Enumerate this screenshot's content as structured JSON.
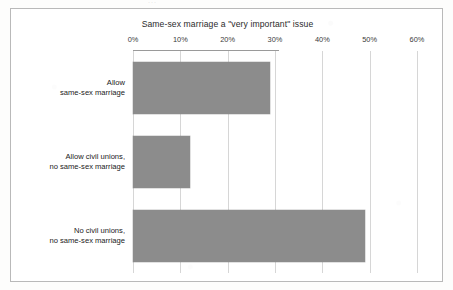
{
  "figure": {
    "title": "Same-sex marriage a \"very important\" issue",
    "frame_color": "#b9b9b9",
    "background": "#ffffff"
  },
  "scan_marks": {
    "top": "···",
    "left": "\\"
  },
  "chart_data": {
    "type": "bar",
    "orientation": "horizontal",
    "title": "Same-sex marriage a \"very important\" issue",
    "xlabel": "",
    "ylabel": "",
    "categories": [
      "Allow same-sex marriage",
      "Allow civil unions, no same-sex marriage",
      "No civil unions, no same-sex marriage"
    ],
    "category_lines": [
      [
        "Allow",
        "same-sex marriage"
      ],
      [
        "Allow civil unions,",
        "no same-sex marriage"
      ],
      [
        "No civil unions,",
        "no same-sex marriage"
      ]
    ],
    "values": [
      29,
      12,
      49
    ],
    "value_unit": "%",
    "xlim": [
      0,
      60
    ],
    "xticks": [
      0,
      10,
      20,
      30,
      40,
      50,
      60
    ],
    "xticklabels": [
      "0%",
      "10%",
      "20%",
      "30%",
      "40%",
      "50%",
      "60%"
    ],
    "grid": true,
    "grid_axis": "x",
    "grid_color": "#d6d6d6",
    "legend": null,
    "bar_color": "#8c8c8c",
    "series": [
      {
        "name": "Same-sex marriage a \"very important\" issue",
        "values": [
          29,
          12,
          49
        ]
      }
    ]
  }
}
